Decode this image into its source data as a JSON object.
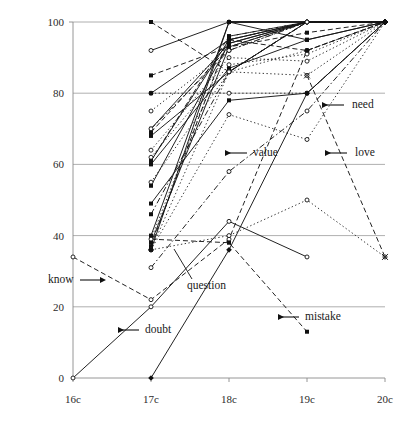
{
  "chart_data": {
    "type": "line",
    "title": "",
    "subtitle": "",
    "xlabel": "",
    "ylabel": "",
    "x": [
      "16c",
      "17c",
      "18c",
      "19c",
      "20c"
    ],
    "xtick_labels": [
      "16c",
      "17c",
      "18c",
      "19c",
      "20c"
    ],
    "ytick_labels": [
      "0",
      "20",
      "40",
      "60",
      "80",
      "100"
    ],
    "ytick_values": [
      0,
      20,
      40,
      60,
      80,
      100
    ],
    "ylim": [
      0,
      100
    ],
    "grid": "horizontal",
    "legend_position": "none",
    "annotations": [
      {
        "label": "need",
        "label_x": 352,
        "label_y": 108,
        "arrow_from_x": 344,
        "arrow_from_y": 105,
        "arrow_to_x": 322,
        "arrow_to_y": 105,
        "style": "arrow-left"
      },
      {
        "label": "love",
        "label_x": 355,
        "label_y": 156,
        "arrow_from_x": 347,
        "arrow_from_y": 153,
        "arrow_to_x": 325,
        "arrow_to_y": 153,
        "style": "arrow-left"
      },
      {
        "label": "value",
        "label_x": 253,
        "label_y": 156,
        "arrow_from_x": 247,
        "arrow_from_y": 153,
        "arrow_to_x": 225,
        "arrow_to_y": 153,
        "style": "arrow-left"
      },
      {
        "label": "mistake",
        "label_x": 305,
        "label_y": 320,
        "arrow_from_x": 299,
        "arrow_from_y": 317,
        "arrow_to_x": 278,
        "arrow_to_y": 317,
        "style": "arrow-left"
      },
      {
        "label": "know",
        "label_x": 48,
        "label_y": 283,
        "arrow_from_x": 80,
        "arrow_from_y": 280,
        "arrow_to_x": 101,
        "arrow_to_y": 280,
        "style": "arrow-right"
      },
      {
        "label": "doubt",
        "label_x": 145,
        "label_y": 333,
        "arrow_from_x": 139,
        "arrow_from_y": 330,
        "arrow_to_x": 118,
        "arrow_to_y": 330,
        "style": "arrow-left"
      },
      {
        "label": "question",
        "label_x": 187,
        "label_y": 289,
        "arrow_from_x": 192,
        "arrow_from_y": 279,
        "arrow_to_x": 174,
        "arrow_to_y": 249,
        "style": "leader"
      }
    ],
    "series": [
      {
        "name": "doubt",
        "style": "solid",
        "marker": "circle",
        "points": [
          [
            0,
            0
          ],
          [
            1,
            20
          ],
          [
            2,
            44
          ],
          [
            3,
            34
          ]
        ]
      },
      {
        "name": "know",
        "style": "dashed",
        "marker": "circle",
        "points": [
          [
            0,
            34
          ],
          [
            1,
            22
          ],
          [
            2,
            39
          ],
          [
            3,
            92
          ],
          [
            4,
            100
          ]
        ]
      },
      {
        "name": "question",
        "style": "solid",
        "marker": "diamond",
        "points": [
          [
            1,
            0
          ],
          [
            2,
            36
          ],
          [
            3,
            80
          ],
          [
            4,
            100
          ]
        ]
      },
      {
        "name": "mistake",
        "style": "dashed",
        "marker": "square",
        "points": [
          [
            1,
            39
          ],
          [
            2,
            38
          ],
          [
            3,
            13
          ]
        ]
      },
      {
        "name": "value",
        "style": "dashdot",
        "marker": "circle",
        "points": [
          [
            1,
            31
          ],
          [
            2,
            58
          ],
          [
            3,
            75
          ],
          [
            4,
            100
          ]
        ]
      },
      {
        "name": "love",
        "style": "dotted",
        "marker": "circle",
        "points": [
          [
            1,
            36
          ],
          [
            2,
            40
          ],
          [
            3,
            50
          ],
          [
            4,
            34
          ]
        ]
      },
      {
        "name": "need",
        "style": "dotted",
        "marker": "circle",
        "points": [
          [
            1,
            36
          ],
          [
            2,
            74
          ],
          [
            3,
            67
          ],
          [
            4,
            100
          ]
        ]
      },
      {
        "name": "s08",
        "style": "dashed",
        "marker": "square",
        "points": [
          [
            1,
            100
          ],
          [
            2,
            86
          ],
          [
            3,
            100
          ],
          [
            4,
            100
          ]
        ]
      },
      {
        "name": "s09",
        "style": "solid",
        "marker": "circle",
        "points": [
          [
            1,
            92
          ],
          [
            2,
            100
          ],
          [
            3,
            100
          ],
          [
            4,
            100
          ]
        ]
      },
      {
        "name": "s10",
        "style": "dashed",
        "marker": "square",
        "points": [
          [
            1,
            85
          ],
          [
            2,
            93
          ],
          [
            3,
            100
          ],
          [
            4,
            100
          ]
        ]
      },
      {
        "name": "s11",
        "style": "dotted",
        "marker": "circle",
        "points": [
          [
            1,
            80
          ],
          [
            2,
            80
          ],
          [
            3,
            80
          ],
          [
            4,
            100
          ]
        ]
      },
      {
        "name": "s12",
        "style": "solid",
        "marker": "square",
        "points": [
          [
            1,
            80
          ],
          [
            2,
            95
          ],
          [
            3,
            100
          ],
          [
            4,
            100
          ]
        ]
      },
      {
        "name": "s13",
        "style": "dotted",
        "marker": "circle",
        "points": [
          [
            1,
            75
          ],
          [
            2,
            92
          ],
          [
            3,
            100
          ],
          [
            4,
            100
          ]
        ]
      },
      {
        "name": "s14",
        "style": "solid",
        "marker": "square",
        "points": [
          [
            1,
            70
          ],
          [
            2,
            94
          ],
          [
            3,
            100
          ],
          [
            4,
            100
          ]
        ]
      },
      {
        "name": "s15",
        "style": "dashed",
        "marker": "square",
        "points": [
          [
            1,
            69
          ],
          [
            2,
            93
          ],
          [
            3,
            97
          ],
          [
            4,
            100
          ]
        ]
      },
      {
        "name": "s16",
        "style": "solid",
        "marker": "square",
        "points": [
          [
            1,
            68
          ],
          [
            2,
            86
          ],
          [
            3,
            100
          ],
          [
            4,
            100
          ]
        ]
      },
      {
        "name": "s17",
        "style": "dotted",
        "marker": "circle",
        "points": [
          [
            1,
            64
          ],
          [
            2,
            90
          ],
          [
            3,
            89
          ],
          [
            4,
            100
          ]
        ]
      },
      {
        "name": "s18",
        "style": "solid",
        "marker": "square",
        "points": [
          [
            1,
            61
          ],
          [
            2,
            95
          ],
          [
            3,
            100
          ],
          [
            4,
            100
          ]
        ]
      },
      {
        "name": "s19",
        "style": "dashed",
        "marker": "square",
        "points": [
          [
            1,
            61
          ],
          [
            2,
            96
          ],
          [
            3,
            100
          ],
          [
            4,
            100
          ]
        ]
      },
      {
        "name": "s20",
        "style": "solid",
        "marker": "square",
        "points": [
          [
            1,
            60
          ],
          [
            2,
            87
          ],
          [
            3,
            95
          ],
          [
            4,
            100
          ]
        ]
      },
      {
        "name": "s21",
        "style": "dotted",
        "marker": "circle",
        "points": [
          [
            1,
            55
          ],
          [
            2,
            86
          ],
          [
            3,
            92
          ],
          [
            4,
            100
          ]
        ]
      },
      {
        "name": "s22",
        "style": "solid",
        "marker": "square",
        "points": [
          [
            1,
            54
          ],
          [
            2,
            94
          ],
          [
            3,
            100
          ],
          [
            4,
            100
          ]
        ]
      },
      {
        "name": "s23",
        "style": "solid",
        "marker": "square",
        "points": [
          [
            1,
            49
          ],
          [
            2,
            78
          ],
          [
            3,
            80
          ],
          [
            4,
            100
          ]
        ]
      },
      {
        "name": "s24",
        "style": "dashdot",
        "marker": "square",
        "points": [
          [
            1,
            46
          ],
          [
            2,
            86
          ],
          [
            3,
            100
          ],
          [
            4,
            100
          ]
        ]
      },
      {
        "name": "s25",
        "style": "solid",
        "marker": "square",
        "points": [
          [
            1,
            40
          ],
          [
            2,
            100
          ],
          [
            3,
            100
          ],
          [
            4,
            100
          ]
        ]
      },
      {
        "name": "s26",
        "style": "dotted",
        "marker": "circle",
        "points": [
          [
            1,
            39
          ],
          [
            2,
            95
          ],
          [
            3,
            100
          ],
          [
            4,
            100
          ]
        ]
      },
      {
        "name": "s27",
        "style": "solid",
        "marker": "square",
        "points": [
          [
            1,
            38
          ],
          [
            2,
            93
          ],
          [
            3,
            100
          ],
          [
            4,
            100
          ]
        ]
      },
      {
        "name": "s28",
        "style": "dashed",
        "marker": "square",
        "points": [
          [
            1,
            37
          ],
          [
            2,
            96
          ],
          [
            3,
            100
          ],
          [
            4,
            100
          ]
        ]
      },
      {
        "name": "s29",
        "style": "dotted",
        "marker": "circle",
        "points": [
          [
            1,
            36
          ],
          [
            2,
            86
          ],
          [
            3,
            85
          ],
          [
            4,
            100
          ]
        ]
      },
      {
        "name": "s30",
        "style": "solid",
        "marker": "square",
        "points": [
          [
            1,
            36
          ],
          [
            2,
            100
          ],
          [
            3,
            100
          ],
          [
            4,
            100
          ]
        ]
      },
      {
        "name": "s31",
        "style": "dashdot",
        "marker": "circle",
        "points": [
          [
            1,
            70
          ],
          [
            2,
            92
          ],
          [
            3,
            100
          ],
          [
            4,
            100
          ]
        ]
      },
      {
        "name": "s32",
        "style": "dotted",
        "marker": "circle",
        "points": [
          [
            1,
            62
          ],
          [
            2,
            88
          ],
          [
            3,
            91
          ],
          [
            4,
            100
          ]
        ]
      },
      {
        "name": "s33",
        "style": "solid",
        "marker": "square",
        "points": [
          [
            2,
            100
          ],
          [
            3,
            100
          ],
          [
            4,
            100
          ]
        ]
      },
      {
        "name": "s34",
        "style": "dashed",
        "marker": "square",
        "points": [
          [
            2,
            95
          ],
          [
            3,
            92
          ],
          [
            4,
            100
          ]
        ]
      },
      {
        "name": "s35",
        "style": "dotted",
        "marker": "circle",
        "points": [
          [
            2,
            86
          ],
          [
            3,
            100
          ],
          [
            4,
            100
          ]
        ]
      },
      {
        "name": "s36",
        "style": "solid",
        "marker": "square",
        "points": [
          [
            2,
            100
          ],
          [
            3,
            95
          ],
          [
            4,
            100
          ]
        ]
      },
      {
        "name": "s37",
        "style": "dashed",
        "marker": "cross",
        "points": [
          [
            3,
            85
          ],
          [
            4,
            34
          ]
        ]
      }
    ]
  },
  "axes": {
    "plot_left": 73,
    "plot_right": 385,
    "plot_top": 22,
    "plot_bottom": 378
  }
}
